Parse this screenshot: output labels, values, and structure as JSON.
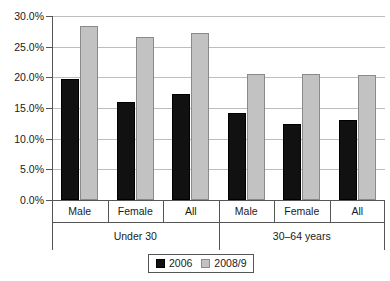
{
  "chart_data": {
    "type": "bar",
    "title": "",
    "xlabel": "",
    "ylabel": "",
    "ylim": [
      0,
      30
    ],
    "ytick_labels": [
      "0.0%",
      "5.0%",
      "10.0%",
      "15.0%",
      "20.0%",
      "25.0%",
      "30.0%"
    ],
    "ytick_values": [
      0,
      5,
      10,
      15,
      20,
      25,
      30
    ],
    "grid": true,
    "legend_position": "bottom",
    "categories": [
      "Male",
      "Female",
      "All",
      "Male",
      "Female",
      "All"
    ],
    "groups": [
      {
        "label": "Under 30",
        "categories": [
          "Male",
          "Female",
          "All"
        ]
      },
      {
        "label": "30–64 years",
        "categories": [
          "Male",
          "Female",
          "All"
        ]
      }
    ],
    "series": [
      {
        "name": "2006",
        "color": "#111111",
        "values": [
          19.8,
          15.9,
          17.3,
          14.2,
          12.4,
          13.1
        ]
      },
      {
        "name": "2008/9",
        "color": "#c2c2c2",
        "values": [
          28.4,
          26.5,
          27.3,
          20.6,
          20.5,
          20.4
        ]
      }
    ]
  },
  "legend": {
    "items": [
      {
        "label": "2006",
        "swatch": "black-square-swatch"
      },
      {
        "label": "2008/9",
        "swatch": "grey-square-swatch"
      }
    ]
  }
}
